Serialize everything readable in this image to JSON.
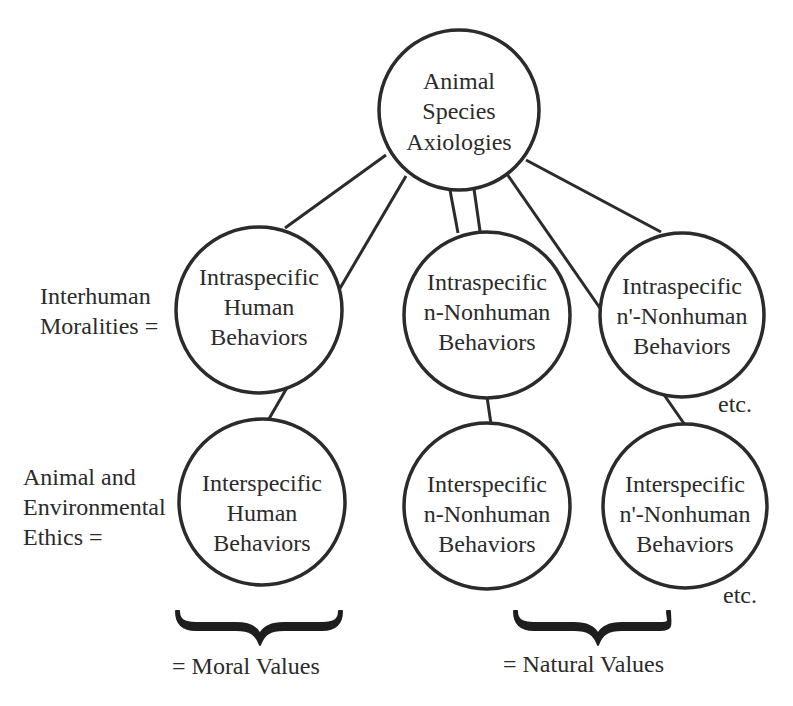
{
  "diagram": {
    "colors": {
      "stroke": "#2b2b2b",
      "text": "#2b2b2b",
      "background": "#ffffff"
    },
    "root": {
      "id": "root",
      "lines": [
        "Animal",
        "Species",
        "Axiologies"
      ]
    },
    "nodes": {
      "intra_human": {
        "lines": [
          "Intraspecific",
          "Human",
          "Behaviors"
        ]
      },
      "intra_n": {
        "lines": [
          "Intraspecific",
          "n-Nonhuman",
          "Behaviors"
        ]
      },
      "intra_n_prime": {
        "lines": [
          "Intraspecific",
          "n'-Nonhuman",
          "Behaviors"
        ]
      },
      "inter_human": {
        "lines": [
          "Interspecific",
          "Human",
          "Behaviors"
        ]
      },
      "inter_n": {
        "lines": [
          "Interspecific",
          "n-Nonhuman",
          "Behaviors"
        ]
      },
      "inter_n_prime": {
        "lines": [
          "Interspecific",
          "n'-Nonhuman",
          "Behaviors"
        ]
      }
    },
    "row_labels": {
      "intraspecific": [
        "Interhuman",
        "Moralities ="
      ],
      "interspecific": [
        "Animal and",
        "Environmental",
        "Ethics ="
      ]
    },
    "etc_labels": [
      "etc.",
      "etc."
    ],
    "brace_labels": {
      "moral": "= Moral Values",
      "natural": "= Natural Values"
    },
    "edges": [
      {
        "from": "root",
        "to": "intra_human"
      },
      {
        "from": "root",
        "to": "inter_human"
      },
      {
        "from": "root",
        "to": "intra_n"
      },
      {
        "from": "root",
        "to": "intra_n"
      },
      {
        "from": "root",
        "to": "intra_n_prime"
      },
      {
        "from": "root",
        "to": "inter_n_prime"
      },
      {
        "from": "intra_human",
        "to": "inter_human"
      },
      {
        "from": "intra_n",
        "to": "inter_n"
      },
      {
        "from": "intra_n_prime",
        "to": "inter_n_prime"
      }
    ]
  }
}
